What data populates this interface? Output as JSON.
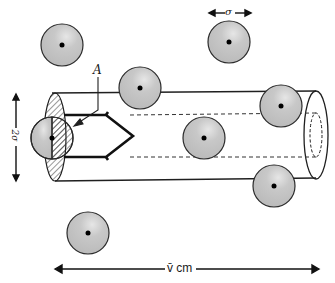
{
  "diagram": {
    "labels": {
      "diameter_label": "σ",
      "cylinder_diameter_label": "2σ",
      "cross_section_label": "A",
      "length_label": "v̄ cm"
    },
    "colors": {
      "sphere_fill": "#c4c4c4",
      "sphere_stroke": "#2a2a2a",
      "line": "#1f1f1f",
      "background": "#ffffff"
    },
    "spheres": [
      {
        "id": "molecule-1",
        "cx": 62,
        "cy": 45,
        "r": 21
      },
      {
        "id": "molecule-2",
        "cx": 140,
        "cy": 88,
        "r": 21
      },
      {
        "id": "molecule-3",
        "cx": 229,
        "cy": 42,
        "r": 21
      },
      {
        "id": "molecule-4",
        "cx": 281,
        "cy": 106,
        "r": 21
      },
      {
        "id": "molecule-5",
        "cx": 204,
        "cy": 138,
        "r": 21
      },
      {
        "id": "molecule-moving",
        "cx": 52,
        "cy": 138,
        "r": 21
      },
      {
        "id": "molecule-6",
        "cx": 274,
        "cy": 186,
        "r": 21
      },
      {
        "id": "molecule-7",
        "cx": 88,
        "cy": 233,
        "r": 21
      }
    ]
  }
}
